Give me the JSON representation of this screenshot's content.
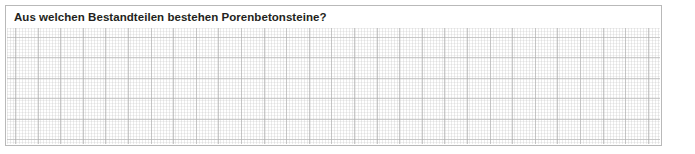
{
  "page": {
    "language": "de",
    "background_color": "#ffffff"
  },
  "cutoff_line_above": {
    "visible_fragment": "▪ ▪ ▪",
    "note": "partially cropped bold text row above the question box"
  },
  "question_card": {
    "border_color": "#b9b9b9",
    "background_color": "#ffffff",
    "title": "Aus welchen Bestandteilen bestehen Porenbetonsteine?",
    "title_color": "#231f20"
  },
  "answer_area": {
    "type": "graph-paper",
    "placeholder": "",
    "value": "",
    "major_line_color": "#a8a8a8",
    "minor_line_color": "#bebebe",
    "major_column_spacing_px": 23,
    "major_row_spacing_px": 20,
    "major_columns": 29,
    "major_rows": 6
  }
}
